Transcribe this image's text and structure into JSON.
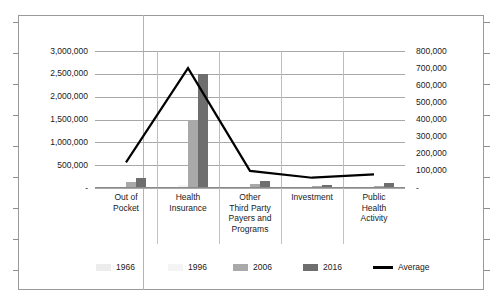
{
  "chart_data": {
    "type": "bar",
    "title": "",
    "subtitle": "",
    "xlabel": "",
    "ylabel": "",
    "y2label": "",
    "grid": true,
    "legend_position": "bottom",
    "categories": [
      "Out of\nPocket",
      "Health\nInsurance",
      "Other\nThird Party\nPayers and\nPrograms",
      "Investment",
      "Public\nHealth\nActivity"
    ],
    "category_lines": [
      [
        "Out of",
        "Pocket"
      ],
      [
        "Health",
        "Insurance"
      ],
      [
        "Other",
        "Third Party",
        "Payers and",
        "Programs"
      ],
      [
        "Investment"
      ],
      [
        "Public",
        "Health",
        "Activity"
      ]
    ],
    "ylim": [
      0,
      3000000
    ],
    "yticks": [
      0,
      500000,
      1000000,
      1500000,
      2000000,
      2500000,
      3000000
    ],
    "ytick_labels": [
      "-",
      "500,000",
      "1,000,000",
      "1,500,000",
      "2,000,000",
      "2,500,000",
      "3,000,000"
    ],
    "y2lim": [
      0,
      800000
    ],
    "y2ticks": [
      0,
      100000,
      200000,
      300000,
      400000,
      500000,
      600000,
      700000,
      800000
    ],
    "y2tick_labels": [
      "-",
      "100,000",
      "200,000",
      "300,000",
      "400,000",
      "500,000",
      "600,000",
      "700,000",
      "800,000"
    ],
    "series": [
      {
        "name": "1966",
        "axis": "left",
        "color": "#ececec",
        "values": [
          8000,
          10000,
          3000,
          1000,
          2000
        ]
      },
      {
        "name": "1996",
        "axis": "left",
        "color": "#f4f4f4",
        "values": [
          20000,
          60000,
          12000,
          5000,
          8000
        ]
      },
      {
        "name": "2006",
        "axis": "left",
        "color": "#a9a9a9",
        "values": [
          130000,
          1500000,
          95000,
          35000,
          45000
        ]
      },
      {
        "name": "2016",
        "axis": "left",
        "color": "#6e6e6e",
        "values": [
          230000,
          2500000,
          150000,
          70000,
          110000
        ]
      },
      {
        "name": "Average",
        "axis": "right",
        "type": "line",
        "color": "#000000",
        "values": [
          150000,
          700000,
          100000,
          60000,
          80000
        ]
      }
    ],
    "legend_entries": [
      {
        "label": "1966",
        "swatch": "#ececec",
        "kind": "bar"
      },
      {
        "label": "1996",
        "swatch": "#f4f4f4",
        "kind": "bar"
      },
      {
        "label": "2006",
        "swatch": "#a9a9a9",
        "kind": "bar"
      },
      {
        "label": "2016",
        "swatch": "#6e6e6e",
        "kind": "bar"
      },
      {
        "label": "Average",
        "swatch": "#000000",
        "kind": "line"
      }
    ]
  }
}
